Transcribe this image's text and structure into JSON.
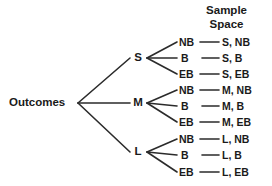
{
  "diagram": {
    "root": {
      "label": "Outcomes"
    },
    "header": {
      "line1": "Sample",
      "line2": "Space"
    },
    "level1": [
      {
        "id": "S",
        "label": "S"
      },
      {
        "id": "M",
        "label": "M"
      },
      {
        "id": "L",
        "label": "L"
      }
    ],
    "level2": [
      {
        "label": "NB"
      },
      {
        "label": "B"
      },
      {
        "label": "EB"
      }
    ],
    "rows": [
      {
        "branch": "S",
        "leaf": "NB",
        "outcome": "S, NB"
      },
      {
        "branch": "S",
        "leaf": "B",
        "outcome": "S, B"
      },
      {
        "branch": "S",
        "leaf": "EB",
        "outcome": "S, EB"
      },
      {
        "branch": "M",
        "leaf": "NB",
        "outcome": "M, NB"
      },
      {
        "branch": "M",
        "leaf": "B",
        "outcome": "M, B"
      },
      {
        "branch": "M",
        "leaf": "EB",
        "outcome": "M, EB"
      },
      {
        "branch": "L",
        "leaf": "NB",
        "outcome": "L, NB"
      },
      {
        "branch": "L",
        "leaf": "B",
        "outcome": "L, B"
      },
      {
        "branch": "L",
        "leaf": "EB",
        "outcome": "L, EB"
      }
    ],
    "colors": {
      "background": "#ffffff",
      "ink": "#1a1a1a",
      "line": "#2b2b2b"
    }
  }
}
